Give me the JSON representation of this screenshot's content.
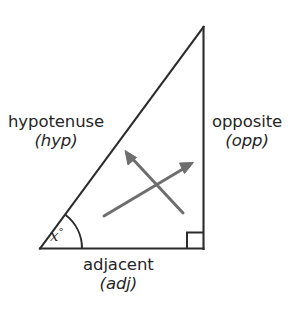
{
  "figure": {
    "labels": {
      "hypotenuse": {
        "word": "hypotenuse",
        "abbr": "(hyp)"
      },
      "opposite": {
        "word": "opposite",
        "abbr": "(opp)"
      },
      "adjacent": {
        "word": "adjacent",
        "abbr": "(adj)"
      },
      "angle": {
        "variable": "x",
        "degree": "°"
      }
    },
    "colors": {
      "triangle_stroke": "#2b2b2b",
      "arrow_stroke": "#6e6e6e",
      "text": "#262626",
      "background": "#ffffff"
    },
    "geometry": {
      "vertex_left": [
        40,
        248
      ],
      "vertex_apex": [
        203,
        27
      ],
      "vertex_right": [
        203,
        248
      ],
      "right_angle_marker": [
        187,
        232,
        16,
        16
      ],
      "angle_arc_radius": 42,
      "arrow_to_hypotenuse": {
        "from": [
          183,
          213
        ],
        "to": [
          126,
          152
        ]
      },
      "arrow_to_opposite": {
        "from": [
          104,
          216
        ],
        "to": [
          192,
          163
        ]
      }
    }
  }
}
